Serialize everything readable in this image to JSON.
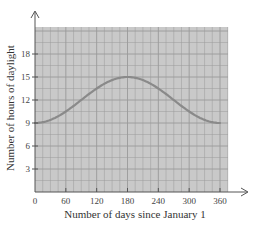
{
  "chart_data": {
    "type": "line",
    "title": "",
    "xlabel": "Number of days since January 1",
    "ylabel": "Number of hours of daylight",
    "xlim": [
      0,
      370
    ],
    "ylim": [
      0,
      21
    ],
    "x_ticks": [
      0,
      60,
      120,
      180,
      240,
      300,
      360
    ],
    "y_ticks": [
      3,
      6,
      9,
      12,
      15,
      18
    ],
    "x_tick_labels": [
      "0",
      "60",
      "120",
      "180",
      "240",
      "300",
      "360"
    ],
    "y_tick_labels": [
      "3",
      "6",
      "9",
      "12",
      "15",
      "18"
    ],
    "grid": true,
    "legend": null,
    "series": [
      {
        "name": "Hours of daylight",
        "x": [
          0,
          30,
          60,
          90,
          120,
          150,
          180,
          210,
          240,
          270,
          300,
          330,
          360
        ],
        "y": [
          9.0,
          9.2,
          9.9,
          10.9,
          12.0,
          13.1,
          15.0,
          14.1,
          12.9,
          11.8,
          10.4,
          9.4,
          9.0
        ]
      }
    ],
    "colors": {
      "grid_background": "#c9c9c9",
      "grid_line": "#9a9a9a",
      "curve": "#8a8a8a",
      "axis": "#555555"
    }
  }
}
